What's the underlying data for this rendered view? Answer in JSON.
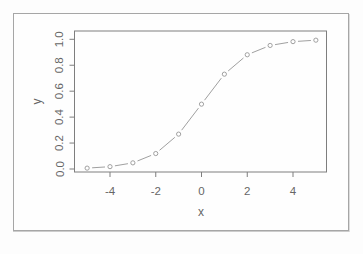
{
  "figure": {
    "background": "#fdfdfd",
    "frame_border_color": "#a6a6a6",
    "plot_background": "#fefefe"
  },
  "chart_data": {
    "type": "line",
    "title": "",
    "xlabel": "x",
    "ylabel": "y",
    "x": [
      -5,
      -4,
      -3,
      -2,
      -1,
      0,
      1,
      2,
      3,
      4,
      5
    ],
    "y": [
      0.0067,
      0.018,
      0.0474,
      0.1192,
      0.2689,
      0.5,
      0.7311,
      0.8808,
      0.9526,
      0.982,
      0.9933
    ],
    "series": [
      {
        "name": "logistic-curve",
        "values": [
          0.0067,
          0.018,
          0.0474,
          0.1192,
          0.2689,
          0.5,
          0.7311,
          0.8808,
          0.9526,
          0.982,
          0.9933
        ]
      }
    ],
    "xticks": [
      "-4",
      "-2",
      "0",
      "2",
      "4"
    ],
    "xtick_values": [
      -4,
      -2,
      0,
      2,
      4
    ],
    "yticks": [
      "0.0",
      "0.2",
      "0.4",
      "0.6",
      "0.8",
      "1.0"
    ],
    "ytick_values": [
      0,
      0.2,
      0.4,
      0.6,
      0.8,
      1.0
    ],
    "xlim": [
      -5.5,
      5.5
    ],
    "ylim": [
      -0.04,
      1.06
    ],
    "grid": false,
    "legend": null,
    "marker": "open-circle",
    "line_style": "segments-with-gaps",
    "series_color": "#a0a0a0",
    "axis_color": "#7e7e7e",
    "text_color": "#666666"
  }
}
